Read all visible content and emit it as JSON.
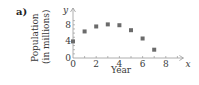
{
  "panel_label": "a)",
  "chart_data": {
    "type": "scatter",
    "title": "",
    "xlabel": "Year",
    "ylabel": "Population (in millions)",
    "ylabel_lines": [
      "Population",
      "(in millions)"
    ],
    "x_axis_symbol": "x",
    "y_axis_symbol": "y",
    "x": [
      0,
      1,
      2,
      3,
      4,
      5,
      6,
      7
    ],
    "y": [
      4,
      6.4,
      7.6,
      8.1,
      7.9,
      6.7,
      4.7,
      2
    ],
    "xticks": [
      0,
      2,
      4,
      6,
      8
    ],
    "yticks": [
      0,
      4,
      8
    ],
    "xlim": [
      0,
      9
    ],
    "ylim": [
      0,
      10
    ],
    "grid": false,
    "legend": null,
    "marker": "square",
    "marker_color": "#6b6b6b"
  }
}
